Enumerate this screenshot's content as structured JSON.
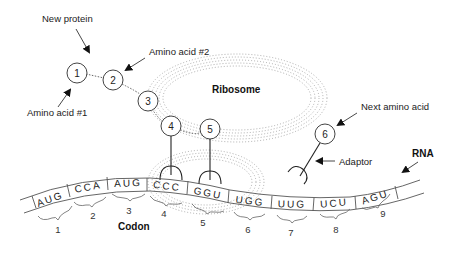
{
  "diagram": {
    "labels": {
      "new_protein": "New protein",
      "amino_acid_1": "Amino acid #1",
      "amino_acid_2": "Amino acid #2",
      "ribosome": "Ribosome",
      "next_amino_acid": "Next amino acid",
      "adaptor": "Adaptor",
      "rna": "RNA",
      "codon": "Codon"
    },
    "amino_acids": [
      {
        "id": "1",
        "x": 130,
        "y": 75
      },
      {
        "id": "2",
        "x": 113,
        "y": 80
      },
      {
        "id": "3",
        "x": 148,
        "y": 101
      },
      {
        "id": "4",
        "x": 172,
        "y": 126
      },
      {
        "id": "5",
        "x": 210,
        "y": 129
      },
      {
        "id": "6",
        "x": 325,
        "y": 134
      }
    ],
    "codons": [
      {
        "seq": "AUG",
        "number": "1"
      },
      {
        "seq": "CCA",
        "number": "2"
      },
      {
        "seq": "AUG",
        "number": "3"
      },
      {
        "seq": "CCC",
        "number": "4"
      },
      {
        "seq": "GGU",
        "number": "5"
      },
      {
        "seq": "UGG",
        "number": "6"
      },
      {
        "seq": "UUG",
        "number": "7"
      },
      {
        "seq": "UCU",
        "number": "8"
      },
      {
        "seq": "AGU",
        "number": "9"
      }
    ]
  }
}
